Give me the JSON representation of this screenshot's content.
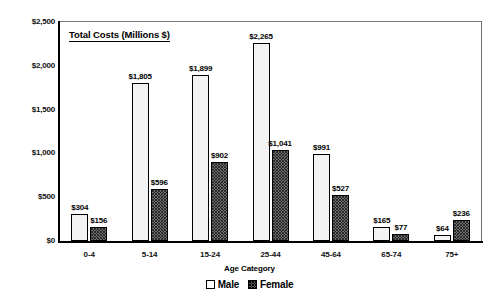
{
  "chart_data": {
    "type": "bar",
    "title": "Total Costs (Millions $)",
    "xlabel": "Age Category",
    "ylabel": "",
    "ylim": [
      0,
      2500
    ],
    "ytick_values": [
      2500,
      2000,
      1500,
      1000,
      500,
      0
    ],
    "ytick_labels": [
      "$2,500",
      "$2,000",
      "$1,500",
      "$1,000",
      "$500",
      "$0"
    ],
    "grid": false,
    "legend_position": "bottom",
    "categories": [
      "0-4",
      "5-14",
      "15-24",
      "25-44",
      "45-64",
      "65-74",
      "75+"
    ],
    "series": [
      {
        "name": "Male",
        "values": [
          304,
          1805,
          1899,
          2265,
          991,
          165,
          64
        ],
        "labels": [
          "$304",
          "$1,805",
          "$1,899",
          "$2,265",
          "$991",
          "$165",
          "$64"
        ]
      },
      {
        "name": "Female",
        "values": [
          156,
          596,
          902,
          1041,
          527,
          77,
          236
        ],
        "labels": [
          "$156",
          "$596",
          "$902",
          "$1,041",
          "$527",
          "$77",
          "$236"
        ]
      }
    ]
  },
  "legend": {
    "items": [
      {
        "label": "Male",
        "pattern": "open-square"
      },
      {
        "label": "Female",
        "pattern": "checkered-square"
      }
    ]
  },
  "colors": {
    "male_fill": "#f3f3f3",
    "female_fill": "#6e6e6e",
    "outline": "#000000",
    "frame": "#6b6b6b",
    "background": "#ffffff"
  }
}
